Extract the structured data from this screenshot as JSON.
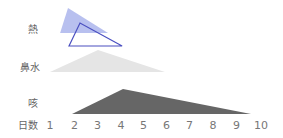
{
  "chart_data": {
    "type": "area",
    "title": "",
    "xlabel": "日数",
    "ylabel": "",
    "x_ticks": [
      "1",
      "2",
      "3",
      "4",
      "5",
      "6",
      "7",
      "8",
      "9",
      "10"
    ],
    "xlim": [
      1,
      10
    ],
    "grid": false,
    "legend": "none",
    "rows": [
      {
        "label": "熱",
        "shapes": [
          {
            "style": "filled",
            "color": "#b8c0ef",
            "base_y": 33,
            "height_px": 25,
            "points": [
              [
                1.43,
                0
              ],
              [
                1.77,
                1
              ],
              [
                3.48,
                0
              ]
            ]
          },
          {
            "style": "outline",
            "color": "#4a4fc0",
            "base_y": 46,
            "height_px": 23,
            "points": [
              [
                1.81,
                0
              ],
              [
                2.28,
                1
              ],
              [
                4.08,
                0
              ]
            ]
          }
        ]
      },
      {
        "label": "鼻水",
        "shapes": [
          {
            "style": "filled",
            "color": "#e5e5e5",
            "base_y": 72,
            "height_px": 22,
            "points": [
              [
                1.0,
                0
              ],
              [
                3.05,
                1
              ],
              [
                5.91,
                0
              ]
            ]
          }
        ]
      },
      {
        "label": "咳",
        "shapes": [
          {
            "style": "filled",
            "color": "#666666",
            "base_y": 114,
            "height_px": 25,
            "points": [
              [
                1.94,
                0
              ],
              [
                4.12,
                1
              ],
              [
                9.59,
                0
              ]
            ]
          }
        ]
      }
    ]
  }
}
